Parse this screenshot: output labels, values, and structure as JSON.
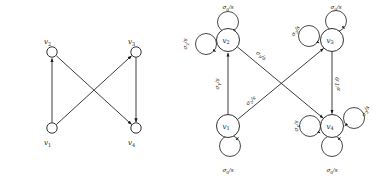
{
  "figure": {
    "stroke_color": "#1a1a1a",
    "background_color": "#ffffff"
  },
  "left_graph": {
    "name": "plain-directed-graph",
    "nodes": [
      {
        "id": "v1",
        "label": "v",
        "sub": "1",
        "cx": 52,
        "cy": 128,
        "r": 5.2,
        "label_x": 46,
        "label_y": 144
      },
      {
        "id": "v2",
        "label": "v",
        "sub": "2",
        "cx": 52,
        "cy": 52,
        "r": 5.2,
        "label_x": 46,
        "label_y": 43
      },
      {
        "id": "v3",
        "label": "v",
        "sub": "3",
        "cx": 136,
        "cy": 52,
        "r": 5.2,
        "label_x": 130,
        "label_y": 43
      },
      {
        "id": "v4",
        "label": "v",
        "sub": "4",
        "cx": 136,
        "cy": 128,
        "r": 5.2,
        "label_x": 130,
        "label_y": 144
      }
    ],
    "edges": [
      {
        "from": "v1",
        "to": "v2",
        "kind": "straight-up"
      },
      {
        "from": "v1",
        "to": "v3",
        "kind": "diagonal-up-right"
      },
      {
        "from": "v2",
        "to": "v4",
        "kind": "diagonal-down-right"
      },
      {
        "from": "v3",
        "to": "v4",
        "kind": "straight-down"
      }
    ]
  },
  "right_graph": {
    "name": "labeled-automaton-graph",
    "nodes": [
      {
        "id": "v1",
        "label": "v",
        "sub": "1",
        "cx": 48,
        "cy": 126,
        "r": 11.5
      },
      {
        "id": "v2",
        "label": "v",
        "sub": "2",
        "cx": 48,
        "cy": 40,
        "r": 11.5
      },
      {
        "id": "v3",
        "label": "v",
        "sub": "3",
        "cx": 152,
        "cy": 40,
        "r": 11.5
      },
      {
        "id": "v4",
        "label": "v",
        "sub": "4",
        "cx": 152,
        "cy": 126,
        "r": 11.5
      }
    ],
    "edges": [
      {
        "from": "v1",
        "to": "v2",
        "label": "σ",
        "sub": "1",
        "denom": "s",
        "label_x": 39,
        "label_y": 84,
        "rotate": -90
      },
      {
        "from": "v1",
        "to": "v3",
        "label": "σ",
        "sub": "2",
        "denom": "s",
        "label_x": 72,
        "label_y": 102,
        "rotate": -39
      },
      {
        "from": "v2",
        "to": "v4",
        "label": "σ",
        "sub": "1",
        "denom": "s",
        "label_x": 80,
        "label_y": 57,
        "rotate": 39
      },
      {
        "from": "v3",
        "to": "v4",
        "label": "s",
        "sub": "",
        "denom": "1.0",
        "label_x": 160,
        "label_y": 84,
        "rotate": -90
      }
    ],
    "self_loops": [
      {
        "node": "v1",
        "position": "bottom",
        "label": "σ",
        "sub": "0",
        "denom": "s",
        "label_x": 48,
        "label_y": 172,
        "rotate": 0
      },
      {
        "node": "v2",
        "position": "top",
        "label": "σ",
        "sub": "0",
        "denom": "s",
        "label_x": 48,
        "label_y": 8,
        "rotate": 0
      },
      {
        "node": "v2",
        "position": "left",
        "label": "σ",
        "sub": "2",
        "denom": "s",
        "label_x": 9,
        "label_y": 40,
        "rotate": -90
      },
      {
        "node": "v3",
        "position": "top",
        "label": "σ",
        "sub": "0",
        "denom": "s",
        "label_x": 152,
        "label_y": 8,
        "rotate": 0
      },
      {
        "node": "v3",
        "position": "left",
        "label": "σ",
        "sub": "2",
        "denom": "s",
        "label_x": 116,
        "label_y": 40,
        "rotate": -55
      },
      {
        "node": "v4",
        "position": "bottom",
        "label": "σ",
        "sub": "0",
        "denom": "s",
        "label_x": 152,
        "label_y": 172,
        "rotate": 0
      },
      {
        "node": "v4",
        "position": "left",
        "label": "σ",
        "sub": "1",
        "denom": "s",
        "label_x": 120,
        "label_y": 126,
        "rotate": -90
      },
      {
        "node": "v4",
        "position": "right",
        "label": "σ",
        "sub": "2",
        "denom": "s",
        "label_x": 187,
        "label_y": 118,
        "rotate": -62
      }
    ]
  }
}
